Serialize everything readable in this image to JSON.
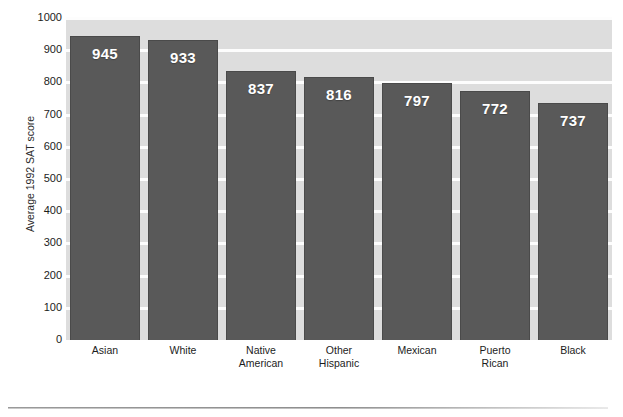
{
  "chart_data": {
    "type": "bar",
    "title": "",
    "xlabel": "",
    "ylabel": "Average 1992 SAT score",
    "categories": [
      "Asian",
      "White",
      "Native American",
      "Other Hispanic",
      "Mexican",
      "Puerto Rican",
      "Black"
    ],
    "category_lines": [
      [
        "Asian"
      ],
      [
        "White"
      ],
      [
        "Native",
        "American"
      ],
      [
        "Other",
        "Hispanic"
      ],
      [
        "Mexican"
      ],
      [
        "Puerto",
        "Rican"
      ],
      [
        "Black"
      ]
    ],
    "values": [
      945,
      933,
      837,
      816,
      797,
      772,
      737
    ],
    "value_labels": [
      "945",
      "933",
      "837",
      "816",
      "797",
      "772",
      "737"
    ],
    "ylim": [
      0,
      1000
    ],
    "yticks": [
      1000,
      900,
      800,
      700,
      600,
      500,
      400,
      300,
      200,
      100,
      0
    ],
    "ytick_labels": [
      "1000",
      "900",
      "800",
      "700",
      "600",
      "500",
      "400",
      "300",
      "200",
      "100",
      "0"
    ],
    "grid": true,
    "grid_orientation": "horizontal",
    "legend": false,
    "legend_position": "none"
  },
  "colors": {
    "bar_fill": "#595959",
    "bar_edge": "#4a4a4a",
    "plot_background": "#dddddd",
    "gridline": "#fdfdfd",
    "value_label": "#ffffff",
    "axis_text": "#1c1c1c",
    "page_background": "#ffffff"
  }
}
